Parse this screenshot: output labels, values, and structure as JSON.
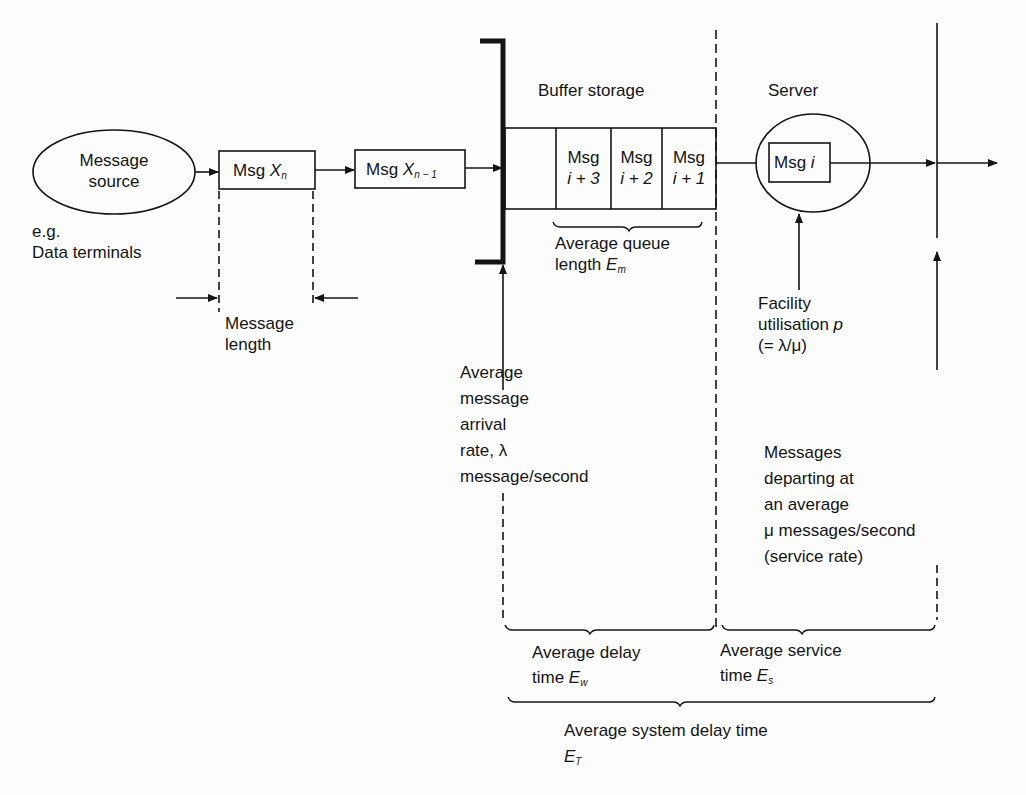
{
  "diagram": {
    "type": "queueing-system",
    "nodes": {
      "source": {
        "line1": "Message",
        "line2": "source"
      },
      "source_example": {
        "line1": "e.g.",
        "line2": "Data terminals"
      },
      "msg_xn": {
        "prefix": "Msg",
        "var": "X",
        "sub": "n"
      },
      "msg_xn1": {
        "prefix": "Msg",
        "var": "X",
        "sub": "n − 1"
      },
      "buffer_title": "Buffer storage",
      "buffer_cells": [
        {
          "line1": "",
          "line2": ""
        },
        {
          "line1": "Msg",
          "line2": "i + 3"
        },
        {
          "line1": "Msg",
          "line2": "i + 2"
        },
        {
          "line1": "Msg",
          "line2": "i + 1"
        }
      ],
      "server_title": "Server",
      "server_msg": {
        "prefix": "Msg",
        "var": "i"
      }
    },
    "annotations": {
      "message_length": {
        "line1": "Message",
        "line2": "length"
      },
      "queue_length": {
        "line1": "Average queue",
        "line2_prefix": "length",
        "var": "E",
        "sub": "m"
      },
      "arrival_rate": [
        "Average",
        "message",
        "arrival",
        "rate, λ",
        "message/second"
      ],
      "utilisation": {
        "line1": "Facility",
        "line2_prefix": "utilisation",
        "var": "p",
        "line3": "(= λ/μ)"
      },
      "departure": [
        "Messages",
        "departing at",
        "an average",
        "μ messages/second",
        "(service rate)"
      ],
      "delay_time": {
        "line1": "Average delay",
        "line2_prefix": "time",
        "var": "E",
        "sub": "w"
      },
      "service_time": {
        "line1": "Average service",
        "line2_prefix": "time",
        "var": "E",
        "sub": "s"
      },
      "system_delay": {
        "line1": "Average system delay time",
        "var": "E",
        "sub": "T"
      }
    },
    "colors": {
      "ink": "#141414",
      "background": "#fdfdfd"
    }
  }
}
